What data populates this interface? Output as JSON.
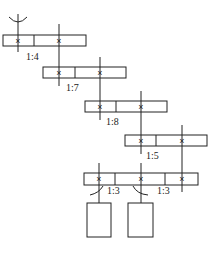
{
  "diagram": {
    "type": "gear-train-schematic",
    "stages": [
      {
        "id": "stage-1",
        "box": {
          "x": 3,
          "y": 35,
          "w": 83,
          "h": 11,
          "dividers": [
            34
          ]
        },
        "marks": [
          18,
          59
        ],
        "ratio": "1:4",
        "ratio_pos": {
          "x": 26,
          "y": 60
        }
      },
      {
        "id": "stage-2",
        "box": {
          "x": 43,
          "y": 67,
          "w": 83,
          "h": 11,
          "dividers": [
            75
          ]
        },
        "marks": [
          59,
          100
        ],
        "ratio": "1:7",
        "ratio_pos": {
          "x": 66,
          "y": 91
        }
      },
      {
        "id": "stage-3",
        "box": {
          "x": 85,
          "y": 101,
          "w": 82,
          "h": 11,
          "dividers": [
            116
          ]
        },
        "marks": [
          100,
          141
        ],
        "ratio": "1:8",
        "ratio_pos": {
          "x": 106,
          "y": 125
        }
      },
      {
        "id": "stage-4",
        "box": {
          "x": 125,
          "y": 135,
          "w": 82,
          "h": 11,
          "dividers": [
            156
          ]
        },
        "marks": [
          141,
          182
        ],
        "ratio": "1:5",
        "ratio_pos": {
          "x": 146,
          "y": 159
        }
      },
      {
        "id": "stage-5",
        "box": {
          "x": 84,
          "y": 173,
          "w": 114,
          "h": 12,
          "dividers": [
            115,
            165
          ]
        },
        "marks": [
          99,
          141,
          182
        ],
        "ratio_left": "1:3",
        "ratio_left_pos": {
          "x": 108,
          "y": 194
        },
        "ratio_right": "1:3",
        "ratio_right_pos": {
          "x": 157,
          "y": 194
        }
      }
    ],
    "mark_glyph": "×",
    "outputs": [
      {
        "id": "output-left",
        "x": 87,
        "y": 203,
        "w": 24,
        "h": 34
      },
      {
        "id": "output-right",
        "x": 128,
        "y": 203,
        "w": 25,
        "h": 34
      }
    ],
    "input_symbol": "arc-cup",
    "colors": {
      "stroke": "#222222",
      "background": "#ffffff"
    }
  }
}
